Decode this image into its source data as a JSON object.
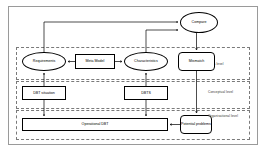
{
  "diagram": {
    "levels": [
      {
        "id": "meta",
        "label": "Meta level"
      },
      {
        "id": "conceptual",
        "label": "Conceptual level"
      },
      {
        "id": "organisational",
        "label": "Organisational level"
      }
    ],
    "nodes": [
      {
        "id": "compare",
        "label": "Compare",
        "shape": "ellipse",
        "level": "above-meta"
      },
      {
        "id": "requirements",
        "label": "Requirements",
        "shape": "ellipse",
        "level": "meta"
      },
      {
        "id": "meta_model",
        "label": "Meta Model",
        "shape": "rect",
        "level": "meta"
      },
      {
        "id": "characteristics",
        "label": "Characteristics",
        "shape": "ellipse",
        "level": "meta"
      },
      {
        "id": "mismatch",
        "label": "Mismatch",
        "shape": "rounded",
        "level": "meta"
      },
      {
        "id": "dbt_situation",
        "label": "DBT situation",
        "shape": "rect",
        "level": "conceptual"
      },
      {
        "id": "dbts",
        "label": "DBTS",
        "shape": "rect",
        "level": "conceptual"
      },
      {
        "id": "operational_dbt",
        "label": "Operational DBT",
        "shape": "rect",
        "level": "organisational"
      },
      {
        "id": "potential_problems",
        "label": "Potential problems",
        "shape": "rounded",
        "level": "organisational"
      }
    ],
    "edges": [
      {
        "from": "requirements",
        "to": "compare",
        "style": "orthogonal",
        "arrow": "to"
      },
      {
        "from": "characteristics",
        "to": "compare",
        "style": "orthogonal",
        "arrow": "to"
      },
      {
        "from": "meta_model",
        "to": "requirements",
        "style": "straight",
        "arrow": "to"
      },
      {
        "from": "meta_model",
        "to": "characteristics",
        "style": "straight",
        "arrow": "to"
      },
      {
        "from": "compare",
        "to": "mismatch",
        "style": "straight",
        "arrow": "to"
      },
      {
        "from": "dbt_situation",
        "to": "requirements",
        "style": "straight",
        "arrow": "to"
      },
      {
        "from": "dbt_situation",
        "to": "operational_dbt",
        "style": "straight",
        "arrow": "to"
      },
      {
        "from": "dbts",
        "to": "characteristics",
        "style": "straight",
        "arrow": "to"
      },
      {
        "from": "dbts",
        "to": "operational_dbt",
        "style": "straight",
        "arrow": "to"
      },
      {
        "from": "mismatch",
        "to": "potential_problems",
        "style": "orthogonal",
        "arrow": "to"
      },
      {
        "from": "potential_problems",
        "to": "operational_dbt",
        "style": "straight",
        "arrow": "to"
      }
    ],
    "colors": {
      "stroke": "#000000",
      "band_stroke": "#7a7a7a",
      "frame_stroke": "#9a9a9a",
      "background": "#ffffff",
      "text": "#000000"
    }
  }
}
